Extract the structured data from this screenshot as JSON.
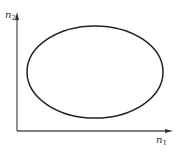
{
  "diagram": {
    "type": "ellipse-in-axes",
    "axes": {
      "x": {
        "label_base": "n",
        "label_sub": "1"
      },
      "y": {
        "label_base": "n",
        "label_sub": "2"
      }
    },
    "shape": {
      "kind": "ellipse",
      "cx": 95,
      "cy": 72,
      "rx": 68,
      "ry": 46
    },
    "colors": {
      "axis": "#555555",
      "curve": "#222222",
      "background": "#ffffff"
    }
  }
}
